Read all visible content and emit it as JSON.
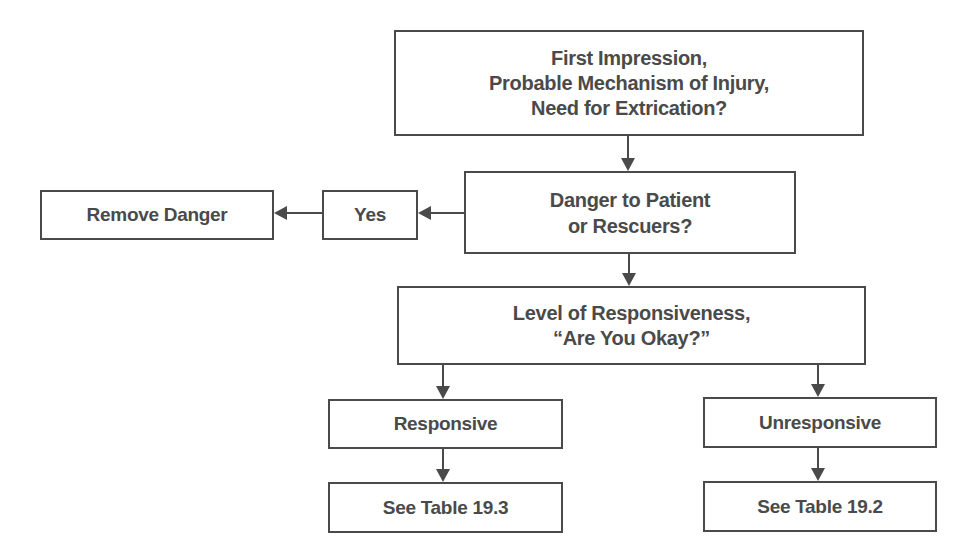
{
  "diagram": {
    "type": "flowchart",
    "line_color": "#4a4a4a",
    "text_color": "#4a4a4a",
    "nodes": [
      {
        "id": "first-impression",
        "label": "First Impression,\nProbable Mechanism of Injury,\nNeed for Extrication?"
      },
      {
        "id": "danger",
        "label": "Danger to Patient\nor Rescuers?"
      },
      {
        "id": "yes",
        "label": "Yes"
      },
      {
        "id": "remove-danger",
        "label": "Remove Danger"
      },
      {
        "id": "level-of-responsiveness",
        "label": "Level of Responsiveness,\n“Are You Okay?”"
      },
      {
        "id": "responsive",
        "label": "Responsive"
      },
      {
        "id": "unresponsive",
        "label": "Unresponsive"
      },
      {
        "id": "see-table-19-3",
        "label": "See Table 19.3"
      },
      {
        "id": "see-table-19-2",
        "label": "See Table 19.2"
      }
    ],
    "edges": [
      {
        "from": "first-impression",
        "to": "danger"
      },
      {
        "from": "danger",
        "to": "yes"
      },
      {
        "from": "yes",
        "to": "remove-danger"
      },
      {
        "from": "danger",
        "to": "level-of-responsiveness"
      },
      {
        "from": "level-of-responsiveness",
        "to": "responsive"
      },
      {
        "from": "level-of-responsiveness",
        "to": "unresponsive"
      },
      {
        "from": "responsive",
        "to": "see-table-19-3"
      },
      {
        "from": "unresponsive",
        "to": "see-table-19-2"
      }
    ]
  }
}
